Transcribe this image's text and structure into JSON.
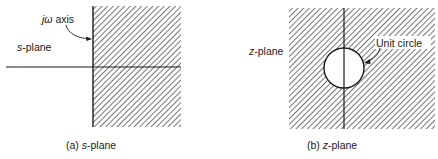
{
  "s_plane": {
    "axis_label_var": "jω",
    "axis_label_rest": " axis",
    "plane_label_var": "s",
    "plane_label_rest": "-plane",
    "caption_prefix": "(a) ",
    "caption_var": "s",
    "caption_rest": "-plane"
  },
  "z_plane": {
    "plane_label_var": "z",
    "plane_label_rest": "-plane",
    "circle_label": "Unit circle",
    "caption_prefix": "(b) ",
    "caption_var": "z",
    "caption_rest": "-plane"
  },
  "colors": {
    "ink": "#1a1a1a",
    "hatch": "#2a2a2a",
    "background": "#ffffff"
  }
}
